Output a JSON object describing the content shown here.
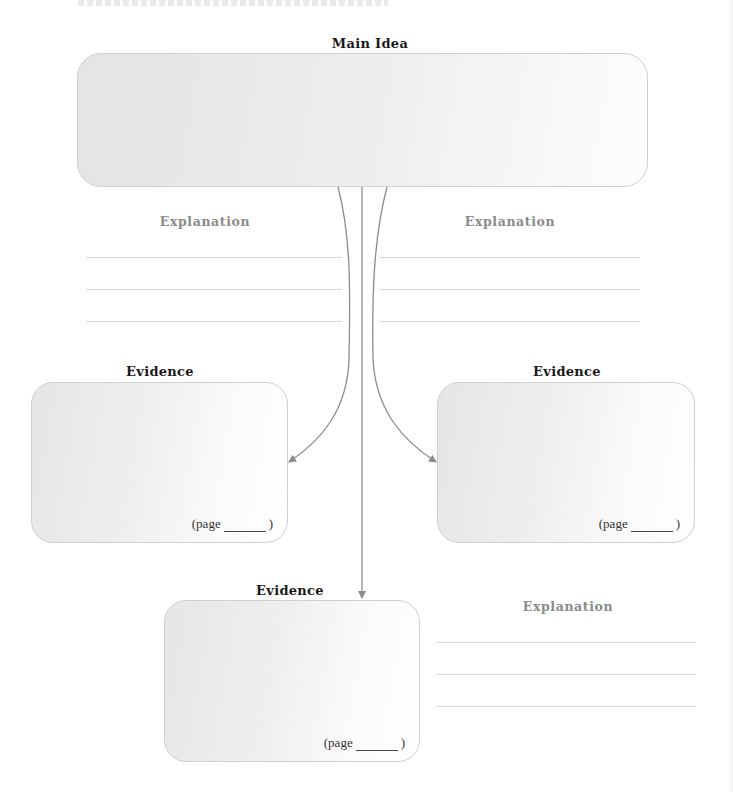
{
  "worksheet": {
    "main_idea": {
      "label": "Main Idea",
      "response": ""
    },
    "evidence": [
      {
        "position": "left",
        "label": "Evidence",
        "page_label": "(page",
        "page_close": ")",
        "page_value": "",
        "response": ""
      },
      {
        "position": "right",
        "label": "Evidence",
        "page_label": "(page",
        "page_close": ")",
        "page_value": "",
        "response": ""
      },
      {
        "position": "bottom",
        "label": "Evidence",
        "page_label": "(page",
        "page_close": ")",
        "page_value": "",
        "response": ""
      }
    ],
    "explanations": [
      {
        "position": "upper-left",
        "label": "Explanation",
        "line_count": 3
      },
      {
        "position": "upper-right",
        "label": "Explanation",
        "line_count": 3
      },
      {
        "position": "lower-right",
        "label": "Explanation",
        "line_count": 3
      }
    ]
  },
  "colors": {
    "heading": "#1a1a1a",
    "explanation_heading": "#8a8a8a",
    "box_fill": "#e8e8e8",
    "box_border": "#cfcfcf",
    "writing_line": "#d5d5d5",
    "arrow": "#8c8c8c"
  }
}
